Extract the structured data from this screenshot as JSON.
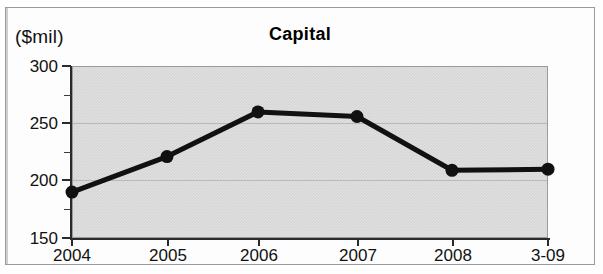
{
  "page": {
    "unit_label": "($mil)"
  },
  "chart_data": {
    "type": "line",
    "title": "Capital",
    "xlabel": "",
    "ylabel": "($mil)",
    "categories": [
      "2004",
      "2005",
      "2006",
      "2007",
      "2008",
      "3-09"
    ],
    "values": [
      190,
      221,
      260,
      256,
      209,
      210
    ],
    "series": [
      {
        "name": "Capital",
        "values": [
          190,
          221,
          260,
          256,
          209,
          210
        ]
      }
    ],
    "ylim": [
      150,
      300
    ],
    "ytick_labels": [
      "150",
      "200",
      "250",
      "300"
    ],
    "ytick_values": [
      150,
      200,
      250,
      300
    ],
    "yminor_values": [
      175,
      225,
      275
    ],
    "grid": true,
    "legend": false,
    "legend_position": "none",
    "marker": "filled-circle",
    "line_color": "#111111",
    "plot_background": "#d7d7d7"
  }
}
